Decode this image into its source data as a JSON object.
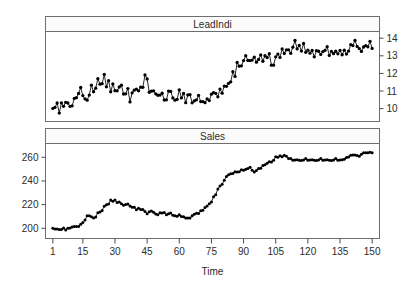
{
  "chart_data": {
    "type": "line",
    "title": "",
    "xlabel": "Time",
    "ylabel": "",
    "grid": false,
    "legend_position": "none",
    "layout": "two stacked panels, shared x axis, alternating y axis sides",
    "x": [
      1,
      2,
      3,
      4,
      5,
      6,
      7,
      8,
      9,
      10,
      11,
      12,
      13,
      14,
      15,
      16,
      17,
      18,
      19,
      20,
      21,
      22,
      23,
      24,
      25,
      26,
      27,
      28,
      29,
      30,
      31,
      32,
      33,
      34,
      35,
      36,
      37,
      38,
      39,
      40,
      41,
      42,
      43,
      44,
      45,
      46,
      47,
      48,
      49,
      50,
      51,
      52,
      53,
      54,
      55,
      56,
      57,
      58,
      59,
      60,
      61,
      62,
      63,
      64,
      65,
      66,
      67,
      68,
      69,
      70,
      71,
      72,
      73,
      74,
      75,
      76,
      77,
      78,
      79,
      80,
      81,
      82,
      83,
      84,
      85,
      86,
      87,
      88,
      89,
      90,
      91,
      92,
      93,
      94,
      95,
      96,
      97,
      98,
      99,
      100,
      101,
      102,
      103,
      104,
      105,
      106,
      107,
      108,
      109,
      110,
      111,
      112,
      113,
      114,
      115,
      116,
      117,
      118,
      119,
      120,
      121,
      122,
      123,
      124,
      125,
      126,
      127,
      128,
      129,
      130,
      131,
      132,
      133,
      134,
      135,
      136,
      137,
      138,
      139,
      140,
      141,
      142,
      143,
      144,
      145,
      146,
      147,
      148,
      149,
      150
    ],
    "xticks": [
      1,
      15,
      30,
      45,
      60,
      75,
      90,
      105,
      120,
      135,
      150
    ],
    "xlim": [
      1,
      150
    ],
    "panels": [
      {
        "name": "LeadIndi",
        "strip_label": "LeadIndi",
        "axis_side": "right",
        "yticks": [
          10,
          11,
          12,
          13,
          14
        ],
        "ylim": [
          9.5,
          14.15
        ],
        "marker": "filled-circle",
        "has_points": true,
        "values": [
          10.01,
          10.07,
          10.32,
          9.75,
          10.33,
          10.13,
          10.36,
          10.32,
          10.13,
          10.16,
          10.58,
          10.62,
          10.86,
          11.2,
          10.74,
          10.56,
          10.48,
          10.77,
          11.33,
          10.96,
          11.16,
          11.7,
          11.39,
          11.42,
          11.94,
          11.24,
          11.59,
          10.96,
          11.4,
          11.02,
          11.01,
          11.23,
          11.33,
          10.83,
          10.84,
          11.14,
          10.38,
          10.9,
          11.05,
          11.11,
          11.01,
          11.22,
          11.21,
          11.91,
          11.69,
          10.93,
          10.99,
          11.01,
          10.84,
          10.76,
          10.77,
          10.88,
          10.49,
          10.5,
          11,
          10.98,
          10.61,
          10.48,
          10.53,
          11.07,
          10.61,
          10.86,
          10.34,
          10.78,
          10.8,
          10.33,
          10.44,
          10.5,
          10.75,
          10.4,
          10.4,
          10.34,
          10.55,
          10.46,
          10.82,
          10.91,
          10.87,
          10.67,
          11.11,
          10.88,
          11.28,
          11.27,
          11.44,
          11.52,
          12.1,
          11.83,
          12.62,
          12.41,
          12.43,
          12.73,
          13.01,
          12.74,
          12.73,
          12.76,
          12.92,
          12.64,
          12.79,
          13.05,
          12.69,
          13.01,
          12.9,
          13.12,
          12.47,
          12.47,
          12.94,
          13.1,
          12.91,
          13.39,
          13.13,
          13.34,
          13.34,
          13.14,
          13.49,
          13.87,
          13.39,
          13.59,
          13.27,
          13.7,
          13.2,
          13.32,
          13.15,
          13.3,
          12.94,
          13.29,
          13.26,
          13.08,
          13.24,
          13.31,
          13.52,
          13.02,
          13.25,
          13.12,
          13.26,
          13.11,
          13.3,
          13.06,
          13.32,
          13.1,
          13.27,
          13.64,
          13.58,
          13.87,
          13.53,
          13.41,
          13.25,
          13.5,
          13.58,
          13.51,
          13.82,
          13.42
        ]
      },
      {
        "name": "Sales",
        "strip_label": "Sales",
        "axis_side": "left",
        "yticks": [
          200,
          220,
          240,
          260
        ],
        "ylim": [
          195,
          268
        ],
        "marker": "filled-circle",
        "has_points": true,
        "values": [
          200.1,
          199.5,
          199.4,
          198.9,
          199,
          200.2,
          198.6,
          200,
          200.3,
          201.2,
          201.6,
          201.5,
          201.5,
          203.5,
          204.9,
          207.1,
          210.5,
          210.5,
          209.8,
          208.8,
          209.5,
          213.2,
          213.7,
          215.1,
          218.7,
          219.8,
          220.5,
          223.8,
          222.8,
          223.8,
          221.7,
          222.3,
          220.8,
          219.4,
          220.1,
          220.6,
          218.9,
          217.8,
          217.7,
          215.6,
          217,
          215.9,
          215.8,
          214.1,
          212.3,
          213.9,
          214.6,
          213.6,
          212.1,
          211.4,
          213.1,
          212.9,
          213.3,
          211.5,
          212.3,
          213,
          211,
          210.7,
          210.1,
          211.4,
          210,
          209.7,
          208.8,
          208.8,
          208.8,
          210.6,
          211.9,
          212.8,
          212.5,
          214.8,
          215.3,
          217.5,
          218.8,
          220.7,
          222.2,
          226.7,
          228.4,
          233.2,
          235.7,
          237.1,
          240.6,
          243.8,
          245.3,
          246,
          246.3,
          247.7,
          247.6,
          247.8,
          249.4,
          249,
          249.9,
          250.5,
          251.5,
          249,
          247.6,
          248.8,
          250.4,
          250.7,
          253,
          253.7,
          255,
          256.2,
          256,
          257.4,
          260.4,
          260,
          261.3,
          260.4,
          261.6,
          260.8,
          259,
          258.9,
          257.4,
          257.7,
          257.9,
          257.4,
          257.3,
          257.6,
          258.9,
          257.4,
          257.7,
          257.9,
          257.4,
          257.3,
          257.6,
          258.9,
          257.4,
          257.7,
          257.9,
          257.4,
          257.3,
          257.6,
          258.9,
          257.4,
          257.7,
          257.9,
          258.3,
          259.8,
          260.2,
          261.7,
          262,
          261.9,
          261.4,
          260.8,
          262.6,
          263.7,
          263.8,
          263.7,
          264.3,
          263.8
        ]
      }
    ]
  },
  "axes": {
    "x_axis_title": "Time",
    "x_tick_labels": [
      "1",
      "15",
      "30",
      "45",
      "60",
      "75",
      "90",
      "105",
      "120",
      "135",
      "150"
    ],
    "top_panel_y_tick_labels": [
      "10",
      "11",
      "12",
      "13",
      "14"
    ],
    "bottom_panel_y_tick_labels": [
      "200",
      "220",
      "240",
      "260"
    ]
  },
  "strips": {
    "top": "LeadIndi",
    "bottom": "Sales"
  },
  "colors": {
    "data": "#000000",
    "frame": "#6e6e6e",
    "strip_fill": "#fbfbfb",
    "text": "#2b2b2b",
    "background": "#ffffff"
  }
}
